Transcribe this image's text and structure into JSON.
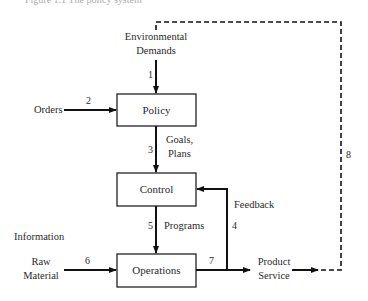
{
  "caption": "Figure 1.1 The policy system",
  "nodes": {
    "policy": {
      "label": "Policy"
    },
    "control": {
      "label": "Control"
    },
    "operations": {
      "label": "Operations"
    }
  },
  "inputs": {
    "environmental_demands_line1": "Environmental",
    "environmental_demands_line2": "Demands",
    "orders": "Orders",
    "information": "Information",
    "raw_material_line1": "Raw",
    "raw_material_line2": "Material"
  },
  "flows": {
    "goals_line1": "Goals,",
    "goals_line2": "Plans",
    "programs": "Programs",
    "feedback": "Feedback",
    "product_line1": "Product",
    "product_line2": "Service"
  },
  "flow_numbers": {
    "n1": "1",
    "n2": "2",
    "n3": "3",
    "n4": "4",
    "n5": "5",
    "n6": "6",
    "n7": "7",
    "n8": "8"
  },
  "colors": {
    "line": "#111111",
    "box_border": "#222222",
    "text": "#2a2a2a"
  }
}
